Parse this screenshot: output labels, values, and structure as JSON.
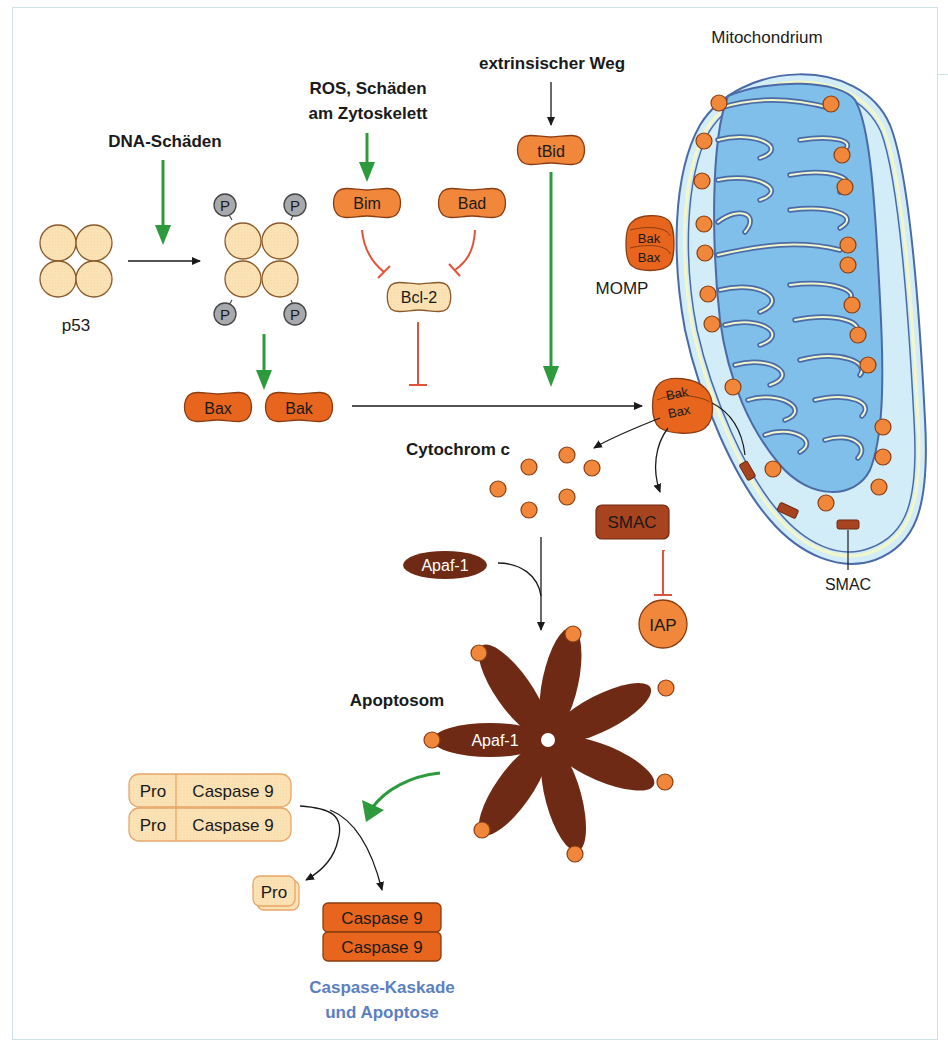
{
  "figure": {
    "title_mitochondrion": "Mitochondrium",
    "labels": {
      "dna_damage": "DNA-Schäden",
      "ros_line1": "ROS, Schäden",
      "ros_line2": "am Zytoskelett",
      "extrinsic": "extrinsischer Weg",
      "p53": "p53",
      "momp": "MOMP",
      "cytochrome_c": "Cytochrom c",
      "apoptosome": "Apoptosom",
      "smac_callout": "SMAC",
      "outcome_line1": "Caspase-Kaskade",
      "outcome_line2": "und Apoptose"
    },
    "proteins": {
      "bim": "Bim",
      "bad": "Bad",
      "tbid": "tBid",
      "bcl2": "Bcl-2",
      "bax": "Bax",
      "bak": "Bak",
      "smac": "SMAC",
      "iap": "IAP",
      "apaf1_free": "Apaf-1",
      "apaf1_apoptosome": "Apaf-1",
      "phospho": "P",
      "pore_bak_top": "Bak",
      "pore_bax_top": "Bax",
      "pore_bak_mid": "Bak",
      "pore_bax_mid": "Bax"
    },
    "procaspase": [
      {
        "pro": "Pro",
        "caspase": "Caspase 9"
      },
      {
        "pro": "Pro",
        "caspase": "Caspase 9"
      }
    ],
    "cleaved_pro": "Pro",
    "active_caspase": [
      "Caspase 9",
      "Caspase 9"
    ],
    "colors": {
      "activation_arrow": "#2e9a3e",
      "inhibition": "#e0533a",
      "pale_protein": "#fbe2b4",
      "orange_protein": "#f0873a",
      "dark_orange": "#e8651e",
      "brown": "#6e2a14",
      "smac_brown": "#a8431f",
      "mito_outer": "#d2ecf8",
      "mito_matrix": "#7fbfea",
      "membrane": "#4b6aa8",
      "outcome_text": "#5b7fc0"
    }
  }
}
